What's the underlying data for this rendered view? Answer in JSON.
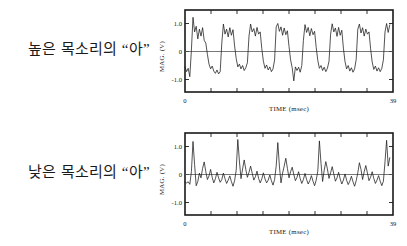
{
  "figure": {
    "background": "#ffffff",
    "line_color": "#1a1a1a"
  },
  "panels": [
    {
      "id": "high-pitch",
      "caption": "높은 목소리의 “아”",
      "chart_data": {
        "type": "line",
        "title": "",
        "xlabel": "TIME (msec)",
        "ylabel": "MAG. (V)",
        "xlim": [
          0,
          39
        ],
        "ylim": [
          -1.55,
          1.45
        ],
        "xticklabels": [
          "0",
          "39"
        ],
        "xtickvalues": [
          0,
          39
        ],
        "xminor_tick_count": 8,
        "yticklabels": [
          "1.0",
          "0",
          "-1.0"
        ],
        "ytickvalues": [
          1.0,
          0,
          -1.0
        ],
        "grid": false,
        "legend": false,
        "zero_reference_line": true,
        "series": [
          {
            "name": "high voice vowel a waveform",
            "period_msec": 4.9,
            "cycle_count": 8,
            "x": [
              0.0,
              0.3,
              0.6,
              0.9,
              1.2,
              1.5,
              1.8,
              2.1,
              2.4,
              2.7,
              3.0,
              3.3,
              3.6,
              3.9,
              4.2,
              4.5,
              4.8,
              5.1,
              5.4,
              5.7,
              6.0,
              6.3,
              6.6,
              6.9,
              7.2,
              7.5,
              7.8,
              8.1,
              8.4,
              8.7,
              9.0,
              9.3,
              9.6,
              9.9,
              10.2,
              10.5,
              10.8,
              11.1,
              11.4,
              11.7,
              12.0,
              12.3,
              12.6,
              12.9,
              13.2,
              13.5,
              13.8,
              14.1,
              14.4,
              14.7,
              15.0,
              15.3,
              15.6,
              15.9,
              16.2,
              16.5,
              16.8,
              17.1,
              17.4,
              17.7,
              18.0,
              18.3,
              18.6,
              18.9,
              19.2,
              19.5,
              19.8,
              20.1,
              20.4,
              20.7,
              21.0,
              21.3,
              21.6,
              21.9,
              22.2,
              22.5,
              22.8,
              23.1,
              23.4,
              23.7,
              24.0,
              24.3,
              24.6,
              24.9,
              25.2,
              25.5,
              25.8,
              26.1,
              26.4,
              26.7,
              27.0,
              27.3,
              27.6,
              27.9,
              28.2,
              28.5,
              28.8,
              29.1,
              29.4,
              29.7,
              30.0,
              30.3,
              30.6,
              30.9,
              31.2,
              31.5,
              31.8,
              32.1,
              32.4,
              32.7,
              33.0,
              33.3,
              33.6,
              33.9,
              34.2,
              34.5,
              34.8,
              35.1,
              35.4,
              35.7,
              36.0,
              36.3,
              36.6,
              36.9,
              37.2,
              37.5,
              37.8,
              38.1,
              38.4,
              38.7,
              39.0
            ],
            "y": [
              -0.55,
              -0.72,
              -0.6,
              -0.9,
              0.05,
              1.22,
              0.7,
              0.9,
              0.45,
              0.8,
              0.55,
              0.85,
              0.4,
              0.3,
              -0.1,
              -0.45,
              -0.62,
              -0.52,
              -0.7,
              -0.78,
              -0.66,
              -0.8,
              -0.72,
              0.3,
              0.98,
              0.62,
              0.8,
              0.52,
              0.85,
              0.58,
              0.78,
              0.2,
              -0.25,
              -0.55,
              -0.45,
              -0.62,
              -0.5,
              -0.68,
              -0.58,
              -0.4,
              0.55,
              0.98,
              0.7,
              0.82,
              0.55,
              0.86,
              0.62,
              0.7,
              0.1,
              -0.35,
              -0.6,
              -0.48,
              -0.66,
              -0.55,
              -0.72,
              -0.62,
              -0.3,
              0.88,
              1.0,
              0.72,
              0.88,
              0.58,
              0.84,
              0.6,
              0.74,
              0.18,
              -0.3,
              -0.58,
              -1.05,
              -0.55,
              -0.68,
              -0.56,
              -0.74,
              -0.5,
              0.4,
              0.96,
              0.68,
              0.86,
              0.56,
              0.82,
              0.6,
              0.72,
              0.15,
              -0.32,
              -0.6,
              -0.5,
              -0.68,
              -0.56,
              -0.72,
              -0.6,
              -0.35,
              0.62,
              0.99,
              0.7,
              0.84,
              0.54,
              0.86,
              0.58,
              0.76,
              0.12,
              -0.36,
              -0.62,
              -0.5,
              -0.7,
              -0.58,
              -0.74,
              -0.62,
              -0.28,
              0.8,
              0.98,
              0.66,
              0.85,
              0.55,
              0.8,
              0.62,
              0.7,
              0.1,
              -0.38,
              -0.64,
              -0.52,
              -0.7,
              -0.58,
              -0.72,
              -0.6,
              -0.3,
              0.7,
              1.0,
              0.68,
              0.95
            ]
          }
        ]
      }
    },
    {
      "id": "low-pitch",
      "caption": "낮은 목소리의 “아”",
      "chart_data": {
        "type": "line",
        "title": "",
        "xlabel": "TIME (msec)",
        "ylabel": "MAG. (V)",
        "xlim": [
          0,
          39
        ],
        "ylim": [
          -1.55,
          1.45
        ],
        "xticklabels": [
          "0",
          "39"
        ],
        "xtickvalues": [
          0,
          39
        ],
        "xminor_tick_count": 8,
        "yticklabels": [
          "1.0",
          "0",
          "-1.0"
        ],
        "ytickvalues": [
          1.0,
          0,
          -1.0
        ],
        "grid": false,
        "legend": false,
        "zero_reference_line": true,
        "series": [
          {
            "name": "low voice vowel a waveform",
            "period_msec": 8.2,
            "cycle_count": 5,
            "x": [
              0.0,
              0.3,
              0.6,
              0.9,
              1.2,
              1.5,
              1.8,
              2.1,
              2.4,
              2.7,
              3.0,
              3.3,
              3.6,
              3.9,
              4.2,
              4.5,
              4.8,
              5.1,
              5.4,
              5.7,
              6.0,
              6.3,
              6.6,
              6.9,
              7.2,
              7.5,
              7.8,
              8.1,
              8.4,
              8.7,
              9.0,
              9.3,
              9.6,
              9.9,
              10.2,
              10.5,
              10.8,
              11.1,
              11.4,
              11.7,
              12.0,
              12.3,
              12.6,
              12.9,
              13.2,
              13.5,
              13.8,
              14.1,
              14.4,
              14.7,
              15.0,
              15.3,
              15.6,
              15.9,
              16.2,
              16.5,
              16.8,
              17.1,
              17.4,
              17.7,
              18.0,
              18.3,
              18.6,
              18.9,
              19.2,
              19.5,
              19.8,
              20.1,
              20.4,
              20.7,
              21.0,
              21.3,
              21.6,
              21.9,
              22.2,
              22.5,
              22.8,
              23.1,
              23.4,
              23.7,
              24.0,
              24.3,
              24.6,
              24.9,
              25.2,
              25.5,
              25.8,
              26.1,
              26.4,
              26.7,
              27.0,
              27.3,
              27.6,
              27.9,
              28.2,
              28.5,
              28.8,
              29.1,
              29.4,
              29.7,
              30.0,
              30.3,
              30.6,
              30.9,
              31.2,
              31.5,
              31.8,
              32.1,
              32.4,
              32.7,
              33.0,
              33.3,
              33.6,
              33.9,
              34.2,
              34.5,
              34.8,
              35.1,
              35.4,
              35.7,
              36.0,
              36.3,
              36.6,
              36.9,
              37.2,
              37.5,
              37.8,
              38.1,
              38.4,
              38.7,
              39.0
            ],
            "y": [
              -0.28,
              -0.3,
              -0.26,
              -0.35,
              0.1,
              1.18,
              0.35,
              -0.4,
              -0.25,
              0.05,
              -0.12,
              0.22,
              0.45,
              0.1,
              -0.18,
              -0.05,
              0.18,
              -0.1,
              -0.3,
              -0.15,
              0.08,
              -0.12,
              -0.28,
              -0.18,
              0.05,
              -0.15,
              -0.32,
              -0.2,
              -0.05,
              -0.25,
              -0.42,
              -0.22,
              0.15,
              1.25,
              0.48,
              -0.15,
              0.2,
              0.52,
              0.18,
              -0.1,
              0.08,
              0.3,
              0.05,
              -0.2,
              -0.08,
              0.12,
              -0.14,
              -0.3,
              -0.16,
              0.06,
              -0.16,
              -0.3,
              -0.2,
              -0.02,
              -0.22,
              -0.38,
              -0.18,
              0.3,
              1.14,
              0.3,
              -0.3,
              0.05,
              0.3,
              0.58,
              0.22,
              -0.12,
              0.1,
              0.26,
              0.0,
              -0.22,
              -0.1,
              0.1,
              -0.15,
              -0.32,
              -0.18,
              0.04,
              -0.18,
              -0.34,
              -0.22,
              -0.04,
              -0.24,
              -0.4,
              -0.2,
              0.12,
              1.2,
              0.4,
              -0.25,
              0.15,
              0.46,
              0.2,
              -0.14,
              0.06,
              0.28,
              0.02,
              -0.24,
              -0.12,
              0.08,
              -0.16,
              -0.34,
              -0.2,
              0.02,
              -0.2,
              -0.36,
              -0.24,
              -0.06,
              -0.26,
              -0.42,
              -0.22,
              0.06,
              0.42,
              0.18,
              -0.18,
              0.1,
              0.32,
              0.06,
              -0.22,
              -0.1,
              0.1,
              -0.14,
              -0.32,
              -0.2,
              -0.04,
              -0.24,
              -0.4,
              -0.24,
              0.45,
              1.22,
              0.3,
              0.6
            ]
          }
        ]
      }
    }
  ]
}
